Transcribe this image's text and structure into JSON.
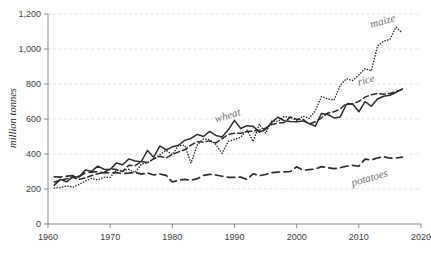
{
  "chart_data": {
    "type": "line",
    "title": "",
    "xlabel": "",
    "ylabel": "million tonnes",
    "xlim": [
      1960,
      2020
    ],
    "ylim": [
      0,
      1200
    ],
    "grid": true,
    "legend_position": "inline-labels",
    "x_ticks": [
      "1960",
      "1970",
      "1980",
      "1990",
      "2000",
      "2010",
      "2020"
    ],
    "y_ticks": [
      "0",
      "200",
      "400",
      "600",
      "800",
      "1,000",
      "1,200"
    ],
    "x": [
      1961,
      1962,
      1963,
      1964,
      1965,
      1966,
      1967,
      1968,
      1969,
      1970,
      1971,
      1972,
      1973,
      1974,
      1975,
      1976,
      1977,
      1978,
      1979,
      1980,
      1981,
      1982,
      1983,
      1984,
      1985,
      1986,
      1987,
      1988,
      1989,
      1990,
      1991,
      1992,
      1993,
      1994,
      1995,
      1996,
      1997,
      1998,
      1999,
      2000,
      2001,
      2002,
      2003,
      2004,
      2005,
      2006,
      2007,
      2008,
      2009,
      2010,
      2011,
      2012,
      2013,
      2014,
      2015,
      2016,
      2017
    ],
    "series": [
      {
        "name": "maize",
        "style": "dotted",
        "label_x": 2012,
        "label_y": 1120,
        "values": [
          205,
          208,
          218,
          210,
          226,
          245,
          260,
          252,
          267,
          266,
          308,
          305,
          313,
          293,
          342,
          350,
          372,
          396,
          421,
          397,
          449,
          450,
          348,
          452,
          486,
          482,
          455,
          404,
          472,
          483,
          496,
          537,
          471,
          571,
          518,
          589,
          586,
          615,
          608,
          592,
          616,
          604,
          646,
          729,
          714,
          708,
          791,
          830,
          820,
          852,
          888,
          875,
          1017,
          1045,
          1054,
          1126,
          1090
        ]
      },
      {
        "name": "rice",
        "style": "dashed",
        "label_x": 2010,
        "label_y": 790,
        "values": [
          240,
          250,
          258,
          267,
          255,
          263,
          277,
          287,
          294,
          316,
          311,
          300,
          336,
          333,
          357,
          351,
          372,
          387,
          377,
          397,
          412,
          424,
          451,
          470,
          469,
          475,
          463,
          487,
          512,
          518,
          519,
          528,
          531,
          536,
          548,
          569,
          577,
          580,
          611,
          599,
          599,
          571,
          584,
          607,
          634,
          641,
          657,
          689,
          685,
          701,
          725,
          739,
          745,
          742,
          746,
          756,
          770
        ]
      },
      {
        "name": "wheat",
        "style": "solid",
        "label_x": 1987,
        "label_y": 580,
        "values": [
          222,
          255,
          241,
          270,
          268,
          308,
          301,
          331,
          313,
          311,
          348,
          339,
          372,
          360,
          356,
          420,
          382,
          446,
          423,
          441,
          450,
          478,
          489,
          512,
          500,
          529,
          506,
          497,
          538,
          592,
          546,
          562,
          558,
          525,
          540,
          582,
          610,
          590,
          586,
          585,
          589,
          574,
          559,
          632,
          626,
          606,
          612,
          683,
          687,
          641,
          699,
          673,
          714,
          730,
          736,
          753,
          772
        ]
      },
      {
        "name": "potatoes",
        "style": "longdash",
        "label_x": 2009,
        "label_y": 215,
        "values": [
          270,
          268,
          273,
          276,
          272,
          292,
          296,
          299,
          292,
          293,
          294,
          288,
          291,
          295,
          285,
          292,
          280,
          286,
          278,
          240,
          250,
          255,
          250,
          259,
          278,
          284,
          280,
          273,
          267,
          266,
          268,
          255,
          287,
          276,
          283,
          294,
          297,
          298,
          300,
          327,
          307,
          311,
          314,
          328,
          322,
          316,
          322,
          330,
          335,
          330,
          371,
          366,
          377,
          385,
          376,
          377,
          382
        ]
      }
    ]
  }
}
